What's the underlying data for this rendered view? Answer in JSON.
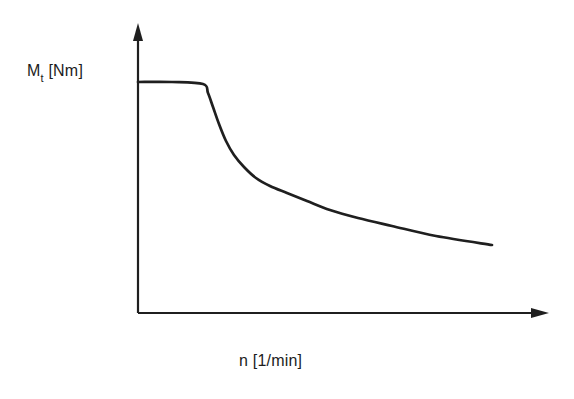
{
  "chart_data": {
    "type": "line",
    "title": "",
    "xlabel": "n [1/min]",
    "ylabel": "Mt [Nm]",
    "ylabel_parts": {
      "symbol": "M",
      "subscript": "t",
      "unit": "[Nm]"
    },
    "x_ticks": [],
    "y_ticks": [],
    "grid": false,
    "legend": false,
    "line_color": "#1f1f1f",
    "axis_color": "#1f1f1f",
    "background_color": "#ffffff",
    "axes_px": {
      "origin": [
        138,
        313
      ],
      "x_end": [
        549,
        313
      ],
      "y_end": [
        138,
        23
      ]
    },
    "series": [
      {
        "name": "torque-speed characteristic",
        "description": "constant torque plateau at high level for low speeds, then hyperbolic (constant-power) decay toward higher speeds",
        "points_px": [
          [
            138,
            82
          ],
          [
            172,
            82
          ],
          [
            203,
            84
          ],
          [
            208,
            93
          ],
          [
            213,
            107
          ],
          [
            219,
            124
          ],
          [
            226,
            141
          ],
          [
            234,
            155
          ],
          [
            244,
            167
          ],
          [
            256,
            178
          ],
          [
            270,
            186
          ],
          [
            287,
            193
          ],
          [
            307,
            201
          ],
          [
            330,
            210
          ],
          [
            358,
            218
          ],
          [
            392,
            226
          ],
          [
            436,
            236
          ],
          [
            492,
            245
          ]
        ]
      }
    ]
  }
}
